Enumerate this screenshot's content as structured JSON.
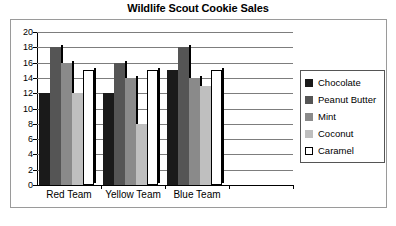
{
  "chart_data": {
    "type": "bar",
    "title": "Wildlife Scout Cookie Sales",
    "xlabel": "",
    "ylabel": "",
    "ylim": [
      0,
      20
    ],
    "ytick_step": 2,
    "yticks": [
      20,
      18,
      16,
      14,
      12,
      10,
      8,
      6,
      4,
      2,
      0
    ],
    "grid": true,
    "legend_position": "right",
    "categories": [
      "Red Team",
      "Yellow Team",
      "Blue Team"
    ],
    "series": [
      {
        "name": "Chocolate",
        "color": "#1a1a1a",
        "values": [
          12,
          12,
          15
        ]
      },
      {
        "name": "Peanut Butter",
        "color": "#555555",
        "values": [
          18,
          16,
          18
        ]
      },
      {
        "name": "Mint",
        "color": "#8a8a8a",
        "values": [
          16,
          14,
          14
        ]
      },
      {
        "name": "Coconut",
        "color": "#bfbfbf",
        "values": [
          12,
          8,
          13
        ]
      },
      {
        "name": "Caramel",
        "color": "#ffffff",
        "values": [
          15,
          15,
          15
        ]
      }
    ]
  },
  "legend": {
    "items": [
      {
        "label": "Chocolate"
      },
      {
        "label": "Peanut Butter"
      },
      {
        "label": "Mint"
      },
      {
        "label": "Coconut"
      },
      {
        "label": "Caramel"
      }
    ]
  },
  "colors": {
    "chocolate": "#1a1a1a",
    "peanut_butter": "#555555",
    "mint": "#8a8a8a",
    "coconut": "#bfbfbf",
    "caramel": "#ffffff",
    "gridline": "#7d7d7d",
    "axis": "#000000",
    "frame": "#9a9a9a",
    "background": "#ffffff"
  }
}
